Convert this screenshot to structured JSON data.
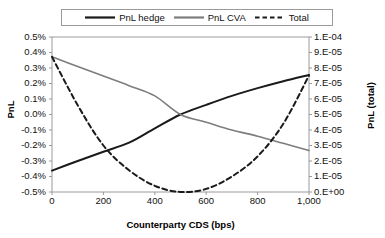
{
  "chart_data": {
    "type": "line",
    "title": "",
    "xlabel": "Counterparty CDS (bps)",
    "ylabel": "PnL",
    "y2label": "PnL (total)",
    "grid": false,
    "legend_position": "top",
    "x": [
      0,
      100,
      200,
      300,
      400,
      500,
      600,
      700,
      800,
      900,
      1000
    ],
    "xlim": [
      0,
      1000
    ],
    "xticks": [
      0,
      200,
      400,
      600,
      800,
      1000
    ],
    "xticklabels": [
      "0",
      "200",
      "400",
      "600",
      "800",
      "1,000"
    ],
    "ylim": [
      -0.5,
      0.5
    ],
    "yticks": [
      0.5,
      0.4,
      0.3,
      0.2,
      0.1,
      0.0,
      -0.1,
      -0.2,
      -0.3,
      -0.4,
      -0.5
    ],
    "yticklabels": [
      "0.5%",
      "0.4%",
      "0.3%",
      "0.2%",
      "0.1%",
      "0.0%",
      "-0.1%",
      "-0.2%",
      "-0.3%",
      "-0.4%",
      "-0.5%"
    ],
    "y2lim": [
      0.0,
      0.0001
    ],
    "y2ticks": [
      0.0001,
      9e-05,
      8e-05,
      7e-05,
      6e-05,
      5e-05,
      4e-05,
      3e-05,
      2e-05,
      1e-05,
      0.0
    ],
    "y2ticklabels": [
      "1.E-04",
      "9.E-05",
      "8.E-05",
      "7.E-05",
      "6.E-05",
      "5.E-05",
      "4.E-05",
      "3.E-05",
      "2.E-05",
      "1.E-05",
      "0.E+00"
    ],
    "series": [
      {
        "name": "PnL hedge",
        "axis": "left",
        "style": "solid",
        "color": "#1a1a1a",
        "width": 2.0,
        "values": [
          -0.362,
          -0.3,
          -0.24,
          -0.182,
          -0.09,
          0.0,
          0.062,
          0.12,
          0.17,
          0.215,
          0.255
        ]
      },
      {
        "name": "PnL CVA",
        "axis": "left",
        "style": "solid",
        "color": "#7d7d7d",
        "width": 1.6,
        "values": [
          0.372,
          0.31,
          0.248,
          0.186,
          0.12,
          0.0,
          -0.05,
          -0.1,
          -0.14,
          -0.186,
          -0.232
        ]
      },
      {
        "name": "Total",
        "axis": "right",
        "style": "dashed",
        "color": "#1a1a1a",
        "width": 2.0,
        "values_left_scale": [
          0.372,
          0.06,
          -0.2,
          -0.36,
          -0.46,
          -0.5,
          -0.48,
          -0.4,
          -0.27,
          -0.06,
          0.252
        ],
        "values": [
          8.86e-05,
          5.6e-05,
          3e-05,
          1.4e-05,
          4e-06,
          0.0,
          2e-06,
          1e-05,
          2.3e-05,
          4.4e-05,
          7.52e-05
        ]
      }
    ]
  },
  "legend": {
    "items": [
      {
        "label": "PnL hedge",
        "style": "solid",
        "color": "#1a1a1a"
      },
      {
        "label": "PnL CVA",
        "style": "solid",
        "color": "#7d7d7d"
      },
      {
        "label": "Total",
        "style": "dashed",
        "color": "#1a1a1a"
      }
    ]
  },
  "colors": {
    "hedge": "#1a1a1a",
    "cva": "#7d7d7d",
    "total": "#1a1a1a",
    "axis": "#9a9a9a",
    "text": "#111111"
  }
}
